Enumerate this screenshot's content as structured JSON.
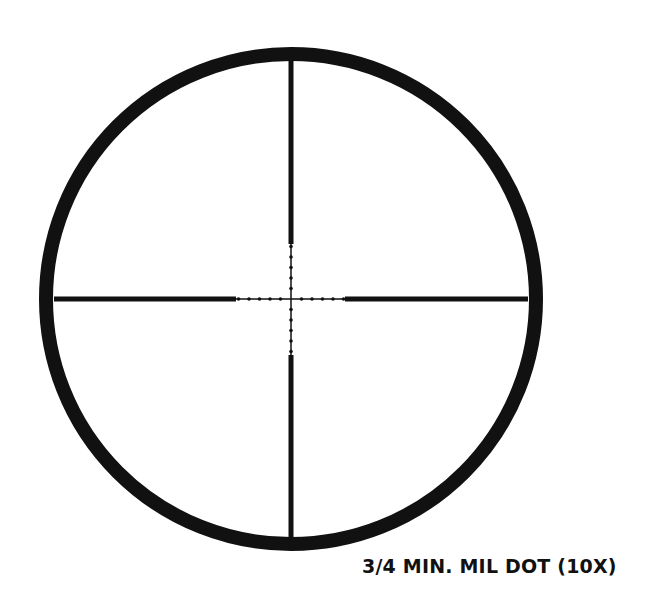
{
  "diagram": {
    "type": "scope-reticle",
    "caption": "3/4 MIN. MIL DOT (10X)",
    "colors": {
      "background": "#ffffff",
      "ink": "#111111"
    },
    "circle": {
      "cx": 291,
      "cy": 299,
      "r": 245,
      "stroke_width": 14
    },
    "crosshair": {
      "thick_post_width": 5,
      "fine_line_width": 1.5,
      "vertical": {
        "x": 291,
        "top": 58,
        "thick_top_end": 244,
        "thick_bottom_start": 355,
        "bottom": 540
      },
      "horizontal": {
        "y": 299,
        "left": 54,
        "thick_left_end": 236,
        "thick_right_start": 345,
        "right": 528
      },
      "mil_dots_per_side": 5,
      "dot_spacing": 10.5
    }
  }
}
